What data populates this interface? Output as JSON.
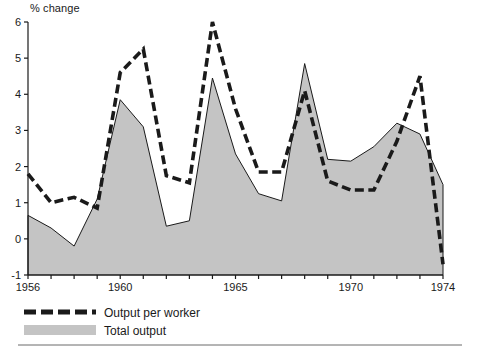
{
  "figure": {
    "y_axis_title": "% change",
    "bottom_rule": true
  },
  "legend": {
    "position": "below-axis-left",
    "items": [
      {
        "label": "Output per worker",
        "style": "dashed-line",
        "color": "#1a1a1a"
      },
      {
        "label": "Total output",
        "style": "filled-area",
        "color": "#c4c4c4"
      }
    ]
  },
  "chart_data": {
    "type": "area",
    "title": "",
    "subtitle": "",
    "xlabel": "",
    "ylabel": "% change",
    "xlim": [
      1956,
      1974
    ],
    "ylim": [
      -1,
      6
    ],
    "grid": false,
    "legend_position": "bottom-left",
    "x": [
      1956,
      1957,
      1958,
      1959,
      1960,
      1961,
      1962,
      1963,
      1964,
      1965,
      1966,
      1967,
      1968,
      1969,
      1970,
      1971,
      1972,
      1973,
      1974
    ],
    "xticks": [
      1956,
      1957,
      1958,
      1959,
      1960,
      1961,
      1962,
      1963,
      1964,
      1965,
      1966,
      1967,
      1968,
      1969,
      1970,
      1971,
      1972,
      1973,
      1974
    ],
    "xtick_labels": [
      "1956",
      "",
      "",
      "",
      "1960",
      "",
      "",
      "",
      "",
      "1965",
      "",
      "",
      "",
      "",
      "1970",
      "",
      "",
      "",
      "1974"
    ],
    "yticks": [
      -1,
      0,
      1,
      2,
      3,
      4,
      5,
      6
    ],
    "ytick_labels": [
      "-1",
      "0",
      "1",
      "2",
      "3",
      "4",
      "5",
      "6"
    ],
    "series": [
      {
        "name": "Output per worker",
        "style": "dashed",
        "color": "#1a1a1a",
        "values": [
          1.8,
          1.0,
          1.15,
          0.85,
          4.6,
          5.25,
          1.75,
          1.55,
          6.0,
          3.6,
          1.85,
          1.85,
          4.1,
          1.6,
          1.35,
          1.35,
          2.7,
          4.5,
          -0.7
        ]
      },
      {
        "name": "Total output",
        "style": "filled-area",
        "color": "#c4c4c4",
        "line_color": "#1a1a1a",
        "values": [
          0.65,
          0.3,
          -0.2,
          1.1,
          3.85,
          3.1,
          0.35,
          0.5,
          4.45,
          2.35,
          1.25,
          1.05,
          4.85,
          2.2,
          2.15,
          2.55,
          3.2,
          2.9,
          1.5
        ]
      }
    ]
  }
}
